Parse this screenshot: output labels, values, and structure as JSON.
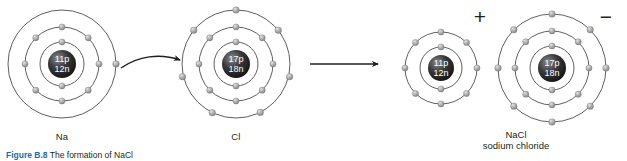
{
  "figure": {
    "caption_number": "Figure B.8",
    "caption_text": "The formation of NaCl",
    "background_color": "#ffffff",
    "ink_color": "#231f20"
  },
  "reactants": {
    "sodium": {
      "label": "Na",
      "nucleus_protons": "11p",
      "nucleus_neutrons": "12n",
      "shell_electron_counts": [
        2,
        8,
        1
      ],
      "center": {
        "x": 62,
        "y": 64
      },
      "shell_radii": [
        22,
        37,
        54
      ],
      "nucleus_radius": 14
    },
    "chlorine": {
      "label": "Cl",
      "nucleus_protons": "17p",
      "nucleus_neutrons": "18n",
      "shell_electron_counts": [
        2,
        8,
        7
      ],
      "center": {
        "x": 236,
        "y": 64
      },
      "shell_radii": [
        22,
        37,
        54
      ],
      "nucleus_radius": 14
    }
  },
  "products": {
    "sodium_ion": {
      "charge_sign": "+",
      "nucleus_protons": "11p",
      "nucleus_neutrons": "12n",
      "shell_electron_counts": [
        2,
        8
      ],
      "center": {
        "x": 441,
        "y": 68
      },
      "shell_radii": [
        21,
        36
      ],
      "nucleus_radius": 13
    },
    "chloride_ion": {
      "charge_sign": "−",
      "nucleus_protons": "17p",
      "nucleus_neutrons": "18n",
      "shell_electron_counts": [
        2,
        8,
        8
      ],
      "center": {
        "x": 552,
        "y": 68
      },
      "shell_radii": [
        22,
        37,
        54
      ],
      "nucleus_radius": 14
    },
    "formula": "NaCl",
    "name": "sodium chloride"
  },
  "arrows": {
    "electron_transfer": {
      "name": "curved-transfer-arrow",
      "from": {
        "x": 120,
        "y": 66
      },
      "to": {
        "x": 182,
        "y": 64
      }
    },
    "reaction": {
      "name": "reaction-arrow",
      "from": {
        "x": 310,
        "y": 64
      },
      "to": {
        "x": 382,
        "y": 64
      }
    }
  },
  "colors": {
    "orbit_stroke": "#4d4d4f",
    "electron_fill": "#9a9a9c",
    "electron_highlight": "#d4d4d6",
    "nucleus_dark": "#1a1a1a",
    "nucleus_light": "#6f6f71",
    "arrow": "#231f20",
    "caption_accent": "#1b6ca8"
  }
}
